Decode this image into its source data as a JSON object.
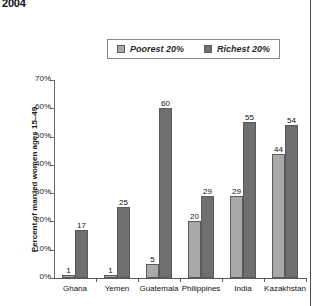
{
  "chart_data": {
    "type": "bar",
    "title": "2004",
    "xlabel": "",
    "ylabel": "Percent of married women ages 15–49",
    "categories": [
      "Ghana",
      "Yemen",
      "Guatemala",
      "Philippines",
      "India",
      "Kazakhstan"
    ],
    "series": [
      {
        "name": "Poorest 20%",
        "color": "#a9a9a9",
        "values": [
          1,
          1,
          5,
          20,
          29,
          44
        ]
      },
      {
        "name": "Richest 20%",
        "color": "#6f6f6f",
        "values": [
          17,
          25,
          60,
          29,
          55,
          54
        ]
      }
    ],
    "ylim": [
      0,
      70
    ],
    "y_ticks": [
      "0%",
      "10%",
      "20%",
      "30%",
      "40%",
      "50%",
      "60%",
      "70%"
    ],
    "y_tick_values": [
      0,
      10,
      20,
      30,
      40,
      50,
      60,
      70
    ],
    "grid": false,
    "legend_position": "top-center"
  }
}
